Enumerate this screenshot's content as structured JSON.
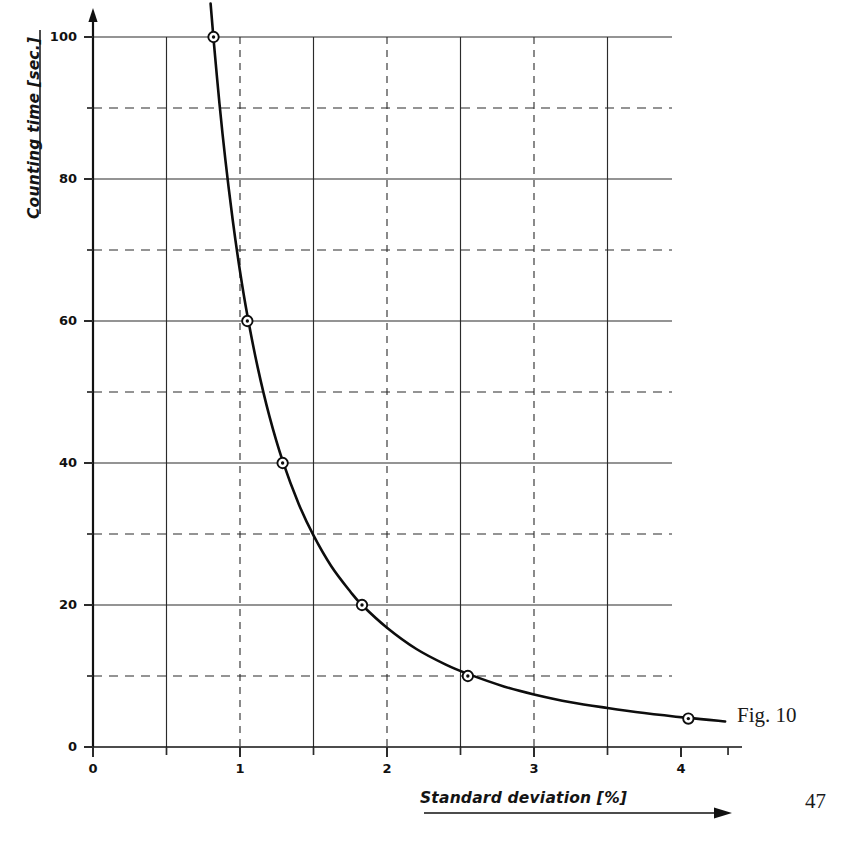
{
  "figure": {
    "caption": "Fig. 10",
    "page_number": "47"
  },
  "chart_data": {
    "type": "line",
    "title": "",
    "xlabel": "Standard deviation [%]",
    "ylabel": "Counting time [sec.]",
    "xlim": [
      0,
      4.4
    ],
    "ylim": [
      0,
      104
    ],
    "grid": true,
    "legend": null,
    "x_major_ticks": [
      0,
      1,
      2,
      3,
      4
    ],
    "x_major_tick_labels": [
      "0",
      "1",
      "2",
      "3",
      "4"
    ],
    "x_minor_ticks": [
      0.5,
      1.5,
      2.5,
      3.5
    ],
    "y_major_ticks": [
      0,
      20,
      40,
      60,
      80,
      100
    ],
    "y_major_tick_labels": [
      "0",
      "20",
      "40",
      "60",
      "80",
      "100"
    ],
    "y_minor_ticks": [
      10,
      30,
      50,
      70,
      90
    ],
    "x_gridlines_solid": [
      0.5,
      1.5,
      2.5,
      3.5
    ],
    "x_gridlines_dashed": [
      1,
      2,
      3
    ],
    "y_gridlines_solid": [
      20,
      40,
      60,
      80,
      100
    ],
    "y_gridlines_dashed": [
      10,
      30,
      50,
      70,
      90
    ],
    "series": [
      {
        "name": "Counting time vs standard deviation",
        "marker": "circle-dot",
        "x": [
          0.82,
          1.05,
          1.29,
          1.83,
          2.55,
          4.05
        ],
        "y": [
          100,
          60,
          40,
          20,
          10,
          4
        ]
      }
    ],
    "curve_x": [
      0.8,
      0.82,
      0.86,
      0.9,
      0.95,
      1.0,
      1.05,
      1.12,
      1.2,
      1.29,
      1.4,
      1.5,
      1.62,
      1.75,
      1.83,
      2.0,
      2.2,
      2.4,
      2.55,
      2.8,
      3.0,
      3.25,
      3.5,
      3.75,
      4.05,
      4.3
    ],
    "curve_y": [
      104.7,
      99.7,
      90.7,
      82.8,
      74.3,
      67.0,
      60.8,
      53.5,
      46.6,
      40.3,
      34.2,
      29.8,
      25.5,
      21.9,
      20.0,
      16.8,
      13.8,
      11.6,
      10.3,
      8.5,
      7.4,
      6.3,
      5.5,
      4.8,
      4.1,
      3.6
    ]
  },
  "axes_geometry": {
    "plot_left_px": 93,
    "plot_right_px": 672,
    "plot_top_px": 37,
    "plot_bottom_px": 747,
    "x_unit_px": 147,
    "y_unit_px": 7.1
  }
}
